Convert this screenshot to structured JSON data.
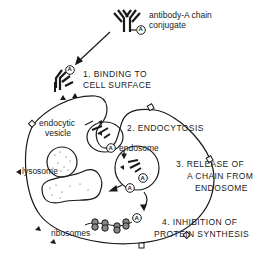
{
  "figure": {
    "legend": {
      "line1": "antibody-A chain",
      "line2": "conjugate",
      "marker": "A"
    },
    "steps": [
      {
        "number": "1.",
        "lines": [
          "1. BINDING TO",
          "CELL SURFACE"
        ]
      },
      {
        "number": "2.",
        "lines": [
          "2. ENDOCYTOSIS"
        ]
      },
      {
        "number": "3.",
        "lines": [
          "3.  RELEASE OF",
          "A CHAIN FROM",
          "ENDOSOME"
        ]
      },
      {
        "number": "4.",
        "lines": [
          "4. INHIBITION OF",
          "PROTEIN SYNTHESIS"
        ]
      }
    ],
    "labels": {
      "endocytic_vesicle_1": "endocytic",
      "endocytic_vesicle_2": "vesicle",
      "endosome": "endosome",
      "lysosome": "lysosome",
      "ribosomes": "ribosomes"
    },
    "a_chain_marker": "A",
    "colors": {
      "ink": "#1a1a1a",
      "background": "#ffffff"
    }
  }
}
